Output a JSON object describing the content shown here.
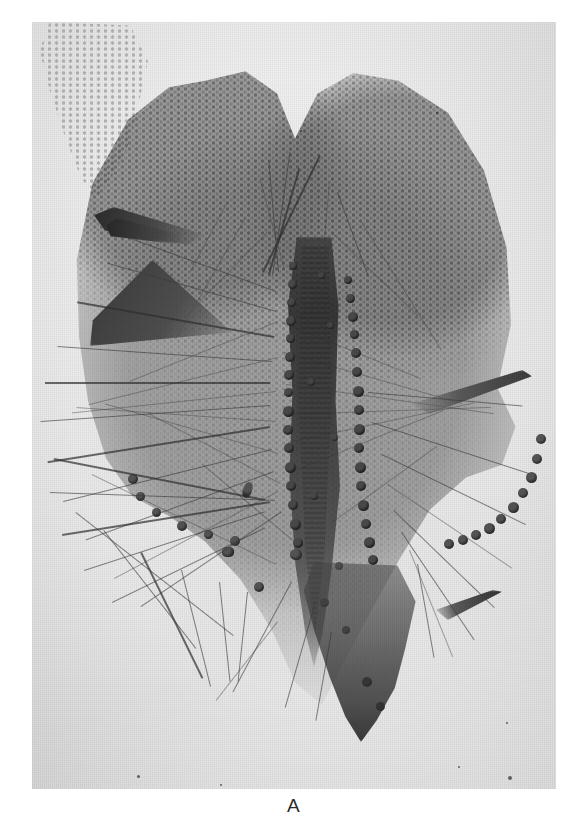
{
  "figure": {
    "panel_label": "A",
    "domain": "Natural-Image",
    "media": "grayscale halftone photomicrograph on printed page",
    "background_color": "#ffffff",
    "plate_color": "#ececeb",
    "ink_color": "#1a1a18",
    "caption_color": "#2a2a2a"
  },
  "plate": {
    "left": 32,
    "top": 22,
    "width": 524,
    "height": 767
  },
  "features": {
    "lobes": [
      "left-lobe",
      "right-lobe"
    ],
    "midrib": "dark central costa running vertically through the specimen",
    "gland_rows": 2,
    "notes": [
      "reticulate areolate cell texture across both lobes",
      "dark wedge-shaped folded tissue on the left margin",
      "long hyaline hairs radiating from the lower-left and right margins",
      "tapering dark base at the lower tip",
      "scattered dust specks on the photographic print"
    ]
  }
}
